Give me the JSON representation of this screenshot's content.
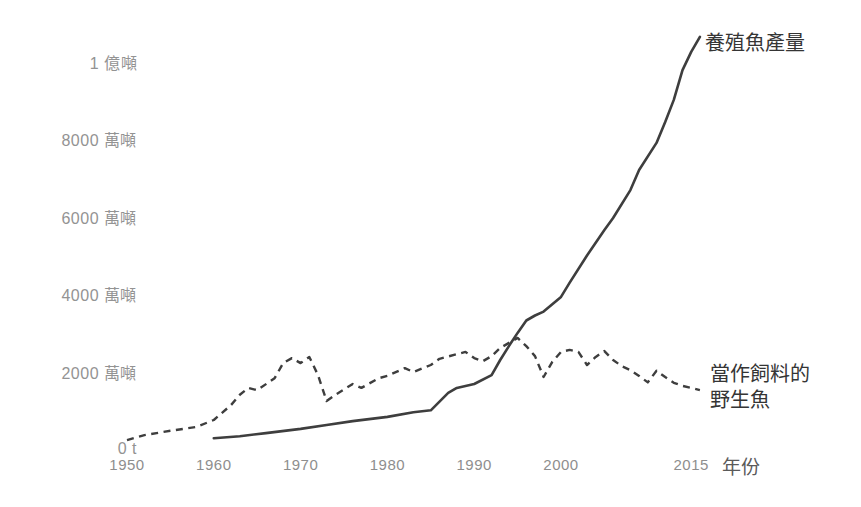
{
  "chart_data": {
    "type": "line",
    "title": "",
    "unit": "萬噸 (10k tonnes)",
    "xlabel": "年份",
    "ylabel": "",
    "grid": false,
    "axis_lines": false,
    "legend_position": "inline-right",
    "line_color": "#3e3e3e",
    "xlim": [
      1950,
      2017
    ],
    "ylim": [
      0,
      11000
    ],
    "x_ticks": [
      {
        "label": "1950",
        "year": 1950
      },
      {
        "label": "1960",
        "year": 1960
      },
      {
        "label": "1970",
        "year": 1970
      },
      {
        "label": "1980",
        "year": 1980
      },
      {
        "label": "1990",
        "year": 1990
      },
      {
        "label": "2000",
        "year": 2000
      },
      {
        "label": "2015",
        "year": 2015
      }
    ],
    "y_ticks": [
      {
        "label": "1 億噸",
        "value": 10000
      },
      {
        "label": "8000 萬噸",
        "value": 8000
      },
      {
        "label": "6000 萬噸",
        "value": 6000
      },
      {
        "label": "4000 萬噸",
        "value": 4000
      },
      {
        "label": "2000 萬噸",
        "value": 2000
      },
      {
        "label": "0 t",
        "value": 0
      }
    ],
    "series": [
      {
        "name": "養殖魚產量",
        "style": "solid",
        "points": [
          [
            1960,
            280
          ],
          [
            1963,
            330
          ],
          [
            1966,
            410
          ],
          [
            1970,
            520
          ],
          [
            1973,
            620
          ],
          [
            1976,
            720
          ],
          [
            1980,
            830
          ],
          [
            1983,
            950
          ],
          [
            1985,
            1000
          ],
          [
            1987,
            1450
          ],
          [
            1988,
            1580
          ],
          [
            1990,
            1680
          ],
          [
            1992,
            1910
          ],
          [
            1993,
            2300
          ],
          [
            1994,
            2660
          ],
          [
            1995,
            3000
          ],
          [
            1996,
            3320
          ],
          [
            1997,
            3450
          ],
          [
            1998,
            3550
          ],
          [
            2000,
            3930
          ],
          [
            2001,
            4300
          ],
          [
            2003,
            5000
          ],
          [
            2005,
            5660
          ],
          [
            2006,
            5970
          ],
          [
            2008,
            6690
          ],
          [
            2009,
            7210
          ],
          [
            2011,
            7910
          ],
          [
            2012,
            8450
          ],
          [
            2013,
            9020
          ],
          [
            2014,
            9790
          ],
          [
            2015,
            10260
          ],
          [
            2016,
            10650
          ]
        ]
      },
      {
        "name": "當作飼料的野生魚",
        "style": "dashed",
        "points": [
          [
            1950,
            230
          ],
          [
            1952,
            360
          ],
          [
            1955,
            470
          ],
          [
            1958,
            570
          ],
          [
            1960,
            750
          ],
          [
            1962,
            1140
          ],
          [
            1963,
            1400
          ],
          [
            1964,
            1580
          ],
          [
            1965,
            1520
          ],
          [
            1967,
            1830
          ],
          [
            1968,
            2220
          ],
          [
            1969,
            2350
          ],
          [
            1970,
            2220
          ],
          [
            1971,
            2380
          ],
          [
            1972,
            1910
          ],
          [
            1973,
            1240
          ],
          [
            1974,
            1400
          ],
          [
            1976,
            1680
          ],
          [
            1977,
            1580
          ],
          [
            1979,
            1830
          ],
          [
            1980,
            1890
          ],
          [
            1982,
            2090
          ],
          [
            1983,
            1990
          ],
          [
            1985,
            2170
          ],
          [
            1986,
            2330
          ],
          [
            1988,
            2450
          ],
          [
            1989,
            2510
          ],
          [
            1990,
            2350
          ],
          [
            1991,
            2270
          ],
          [
            1992,
            2400
          ],
          [
            1993,
            2610
          ],
          [
            1995,
            2870
          ],
          [
            1996,
            2660
          ],
          [
            1997,
            2400
          ],
          [
            1998,
            1860
          ],
          [
            1999,
            2250
          ],
          [
            2000,
            2510
          ],
          [
            2001,
            2560
          ],
          [
            2002,
            2510
          ],
          [
            2003,
            2170
          ],
          [
            2004,
            2380
          ],
          [
            2005,
            2530
          ],
          [
            2006,
            2300
          ],
          [
            2007,
            2140
          ],
          [
            2008,
            2040
          ],
          [
            2009,
            1890
          ],
          [
            2010,
            1720
          ],
          [
            2011,
            2020
          ],
          [
            2012,
            1860
          ],
          [
            2013,
            1710
          ],
          [
            2014,
            1630
          ],
          [
            2015,
            1580
          ],
          [
            2016,
            1520
          ]
        ]
      }
    ]
  }
}
